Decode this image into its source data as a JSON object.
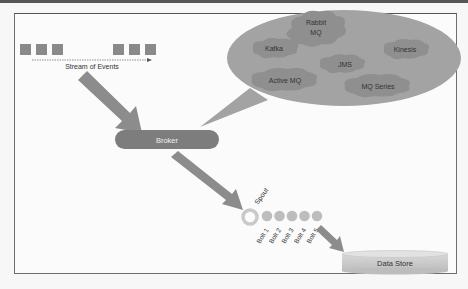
{
  "diagram": {
    "stream": {
      "label": "Stream of Events",
      "event_count_left": 3,
      "event_count_right": 3
    },
    "broker": {
      "label": "Broker"
    },
    "broker_options": [
      {
        "id": "rabbitmq",
        "label_line1": "Rabbit",
        "label_line2": "MQ"
      },
      {
        "id": "kafka",
        "label": "Kafka"
      },
      {
        "id": "kinesis",
        "label": "Kinesis"
      },
      {
        "id": "jms",
        "label": "JMS"
      },
      {
        "id": "activemq",
        "label": "Active MQ"
      },
      {
        "id": "mqseries",
        "label": "MQ Series"
      }
    ],
    "spout": {
      "label": "Spout"
    },
    "bolts": [
      "Bolt 1",
      "Bolt 2",
      "Bolt 3",
      "Bolt 4",
      "Bolt 5"
    ],
    "data_store": {
      "label": "Data Store"
    },
    "colors": {
      "event_square": "#8a8a8a",
      "arrow": "#8c8c8c",
      "broker_fill": "#7d7d7d",
      "ellipse_fill": "#a3a3a3",
      "cloud_fill": "#8f8f8f",
      "spout_ring": "#c9c9c9",
      "bolt_fill": "#bdbdbd",
      "datastore_fill": "#cfcfcf",
      "text_light": "#f0f0f0",
      "text_dark": "#333333"
    }
  }
}
